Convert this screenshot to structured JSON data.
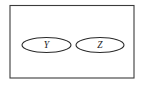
{
  "diagram": {
    "type": "venn-diagram",
    "title": "",
    "universe": {
      "name": "universal-set-rectangle",
      "label": "",
      "x": 10,
      "y": 5.5,
      "width": 124,
      "height": 72.5,
      "stroke_color": "#3b3b3b",
      "fill_color": "#ffffff"
    },
    "sets": [
      {
        "label": "Y",
        "name": "set-y",
        "cx": 46.5,
        "cy": 45,
        "rx": 24.5,
        "ry": 7.5,
        "stroke_color": "#2a2a2a",
        "fill_color": "#ffffff"
      },
      {
        "label": "Z",
        "name": "set-z",
        "cx": 100,
        "cy": 45,
        "rx": 24,
        "ry": 7.5,
        "stroke_color": "#2a2a2a",
        "fill_color": "#ffffff"
      }
    ],
    "relationship": "disjoint",
    "background_color": "#ffffff"
  }
}
